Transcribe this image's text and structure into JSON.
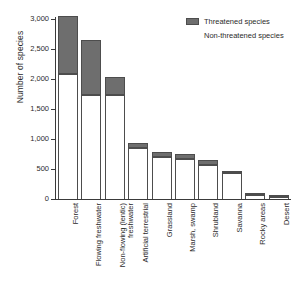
{
  "chart_data": {
    "type": "bar",
    "title": "",
    "subtitle": "",
    "xlabel": "",
    "ylabel": "Number of species",
    "ylim": [
      0,
      3000
    ],
    "ytick_values": [
      0,
      500,
      1000,
      1500,
      2000,
      2500,
      3000
    ],
    "ytick_labels": [
      "0",
      "500",
      "1,000",
      "1,500",
      "2,000",
      "2,500",
      "3,000"
    ],
    "grid": false,
    "stacked": true,
    "legend_position": "top-right",
    "categories": [
      "Forest",
      "Flowing freshwater",
      "Non-flowing (lentic) freshwater",
      "Artificial terrestrial",
      "Grassland",
      "Marsh, swamp",
      "Shrubland",
      "Savanna",
      "Rocky areas",
      "Desert"
    ],
    "category_lines": [
      [
        "Forest"
      ],
      [
        "Flowing freshwater"
      ],
      [
        "Non-flowing (lentic)",
        "freshwater"
      ],
      [
        "Artificial terrestrial"
      ],
      [
        "Grassland"
      ],
      [
        "Marsh, swamp"
      ],
      [
        "Shrubland"
      ],
      [
        "Savanna"
      ],
      [
        "Rocky areas"
      ],
      [
        "Desert"
      ]
    ],
    "series": [
      {
        "name": "Non-threatened species",
        "color": "#ffffff",
        "values": [
          2090,
          1740,
          1730,
          850,
          700,
          670,
          570,
          440,
          60,
          35
        ]
      },
      {
        "name": "Threatened species",
        "color": "#6e6e6e",
        "values": [
          960,
          910,
          300,
          80,
          80,
          80,
          80,
          15,
          25,
          20
        ]
      }
    ],
    "totals": [
      3050,
      2650,
      2030,
      930,
      780,
      750,
      650,
      455,
      85,
      55
    ]
  },
  "legend": {
    "entries": [
      {
        "label": "Threatened species",
        "swatch": "filled"
      },
      {
        "label": "Non-threatened species",
        "swatch": "empty"
      }
    ]
  }
}
